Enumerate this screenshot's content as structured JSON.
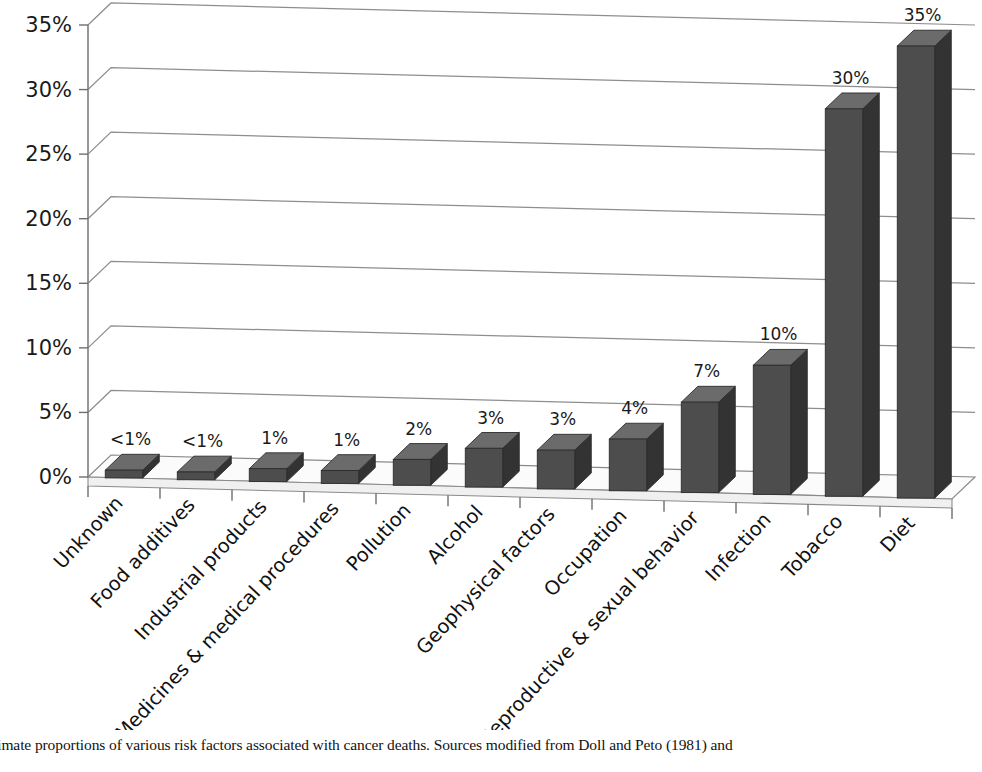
{
  "chart_data": {
    "type": "bar",
    "title": "",
    "subtitle": "",
    "xlabel": "",
    "ylabel": "",
    "ylim": [
      0,
      35
    ],
    "ytick_step": 5,
    "grid": true,
    "legend": "none",
    "rendering": "3d-perspective-column",
    "bar_color": "#4d4d4d",
    "bar_side_color": "#333333",
    "bar_top_color": "#6b6b6b",
    "gridline_color": "#8e8e8e",
    "categories": [
      "Unknown",
      "Food additives",
      "Industrial products",
      "Medicines &  medical procedures",
      "Pollution",
      "Alcohol",
      "Geophysical factors",
      "Occupation",
      "Reproductive & sexual behavior",
      "Infection",
      "Tobacco",
      "Diet"
    ],
    "values": [
      0.6,
      0.6,
      1,
      1,
      2,
      3,
      3,
      4,
      7,
      10,
      30,
      35
    ],
    "data_labels": [
      "<1%",
      "<1%",
      "1%",
      "1%",
      "2%",
      "3%",
      "3%",
      "4%",
      "7%",
      "10%",
      "30%",
      "35%"
    ],
    "ytick_labels": [
      "0%",
      "5%",
      "10%",
      "15%",
      "20%",
      "25%",
      "30%",
      "35%"
    ],
    "ytick_values": [
      0,
      5,
      10,
      15,
      20,
      25,
      30,
      35
    ]
  },
  "caption": {
    "text": "timate proportions of various risk factors associated with cancer deaths. Sources modified from Doll and Peto (1981) and"
  }
}
